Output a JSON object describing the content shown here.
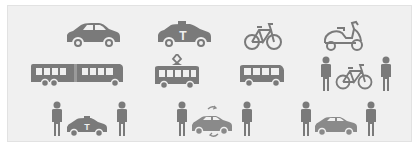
{
  "panel": {
    "background": "#f0f0f0",
    "border": "#e2e2e2",
    "icon_color": "#7a7a7a"
  },
  "rows": [
    {
      "items": [
        {
          "name": "car",
          "label": "Car"
        },
        {
          "name": "taxi",
          "label": "Taxi",
          "glyph": "T"
        },
        {
          "name": "bicycle",
          "label": "Bicycle"
        },
        {
          "name": "scooter",
          "label": "Scooter"
        }
      ]
    },
    {
      "items": [
        {
          "name": "articulated-bus",
          "label": "Articulated bus"
        },
        {
          "name": "tram",
          "label": "Tram"
        },
        {
          "name": "bus",
          "label": "Bus"
        },
        {
          "name": "bike-sharing",
          "label": "Bike sharing"
        }
      ]
    },
    {
      "items": [
        {
          "name": "taxi-sharing",
          "label": "Taxi sharing",
          "glyph": "T"
        },
        {
          "name": "car-sharing",
          "label": "Car sharing"
        },
        {
          "name": "carpooling",
          "label": "Carpooling"
        }
      ]
    }
  ]
}
